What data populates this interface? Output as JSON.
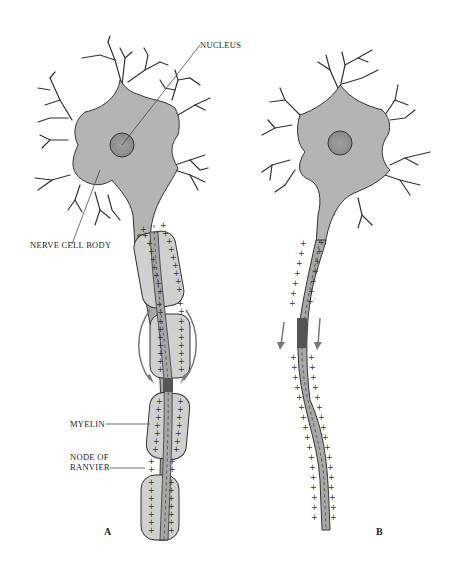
{
  "figure": {
    "panels": [
      {
        "id": "A",
        "label": "A",
        "description": "Myelinated axon with saltatory conduction"
      },
      {
        "id": "B",
        "label": "B",
        "description": "Unmyelinated axon with continuous conduction"
      }
    ],
    "labels": {
      "nucleus": "NUCLEUS",
      "nerve_cell_body": "NERVE CELL BODY",
      "myelin": "MYELIN",
      "node_of_ranvier_line1": "NODE OF",
      "node_of_ranvier_line2": "RANVIER"
    },
    "colors": {
      "cell_fill": "#b4b4b4",
      "myelin_fill": "#d0d0d0",
      "axon_fill": "#a8a8a8",
      "active_region": "#555555",
      "outline": "#333333",
      "arrow": "#777777",
      "background": "#ffffff"
    },
    "symbols": {
      "plus": "+",
      "minus": "-"
    }
  }
}
